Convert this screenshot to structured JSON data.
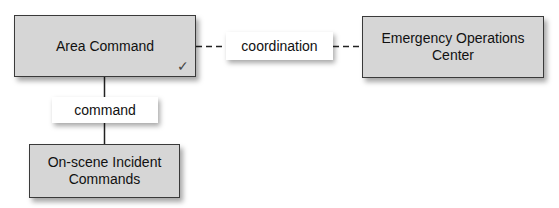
{
  "diagram": {
    "nodes": {
      "area_command": {
        "label": "Area Command",
        "marker": "✓"
      },
      "eoc": {
        "label_line1": "Emergency Operations",
        "label_line2": "Center"
      },
      "onscene": {
        "label_line1": "On-scene Incident",
        "label_line2": "Commands"
      }
    },
    "edges": {
      "coordination": {
        "label": "coordination",
        "style": "dashed",
        "from": "Area Command",
        "to": "Emergency Operations Center"
      },
      "command": {
        "label": "command",
        "style": "solid",
        "from": "Area Command",
        "to": "On-scene Incident Commands"
      }
    }
  }
}
